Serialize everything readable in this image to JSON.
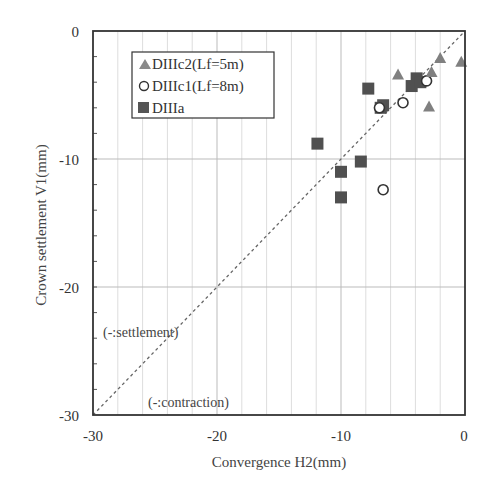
{
  "chart_data": {
    "type": "scatter",
    "title": "",
    "xlabel": "Convergence H2(mm)",
    "ylabel": "Crown settlement V1(mm)",
    "xlim": [
      -30,
      0
    ],
    "ylim": [
      -30,
      0
    ],
    "x_ticks": [
      -30,
      -20,
      -10,
      0
    ],
    "y_ticks": [
      0,
      -10,
      -20,
      -30
    ],
    "grid": true,
    "legend_position": "upper-left",
    "reference_line": {
      "type": "y=x",
      "style": "dashed"
    },
    "annotations": [
      "(-:settlement)",
      "(-:contraction)"
    ],
    "series": [
      {
        "name": "DIIIc2(Lf=5m)",
        "marker": "triangle",
        "color": "#808080",
        "points": [
          [
            -5.4,
            -3.4
          ],
          [
            -2.0,
            -2.1
          ],
          [
            -0.3,
            -2.4
          ],
          [
            -2.9,
            -5.9
          ],
          [
            -2.7,
            -3.2
          ]
        ]
      },
      {
        "name": "DIIIc1(Lf=8m)",
        "marker": "open-circle",
        "color": "#333333",
        "points": [
          [
            -6.9,
            -6.0
          ],
          [
            -5.0,
            -5.6
          ],
          [
            -6.6,
            -12.4
          ],
          [
            -3.1,
            -3.9
          ]
        ]
      },
      {
        "name": "DIIIa",
        "marker": "square",
        "color": "#505050",
        "points": [
          [
            -11.9,
            -8.8
          ],
          [
            -10.0,
            -11.0
          ],
          [
            -10.0,
            -13.0
          ],
          [
            -8.4,
            -10.2
          ],
          [
            -7.8,
            -4.5
          ],
          [
            -6.6,
            -5.8
          ],
          [
            -6.8,
            -6.0
          ],
          [
            -4.3,
            -4.3
          ],
          [
            -3.9,
            -3.7
          ],
          [
            -3.6,
            -4.0
          ]
        ]
      }
    ]
  },
  "labels": {
    "xlabel": "Convergence H2(mm)",
    "ylabel": "Crown settlement V1(mm)",
    "annot_settlement": "(-:settlement)",
    "annot_contraction": "(-:contraction)",
    "xt0": "-30",
    "xt1": "-20",
    "xt2": "-10",
    "xt3": "0",
    "yt0": "0",
    "yt1": "-10",
    "yt2": "-20",
    "yt3": "-30",
    "legend0": "DIIIc2(Lf=5m)",
    "legend1": "DIIIc1(Lf=8m)",
    "legend2": "DIIIa"
  }
}
